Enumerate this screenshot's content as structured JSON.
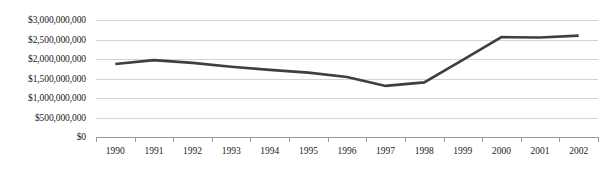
{
  "chart_data": {
    "type": "line",
    "title": "",
    "xlabel": "",
    "ylabel": "",
    "categories": [
      "1990",
      "1991",
      "1992",
      "1993",
      "1994",
      "1995",
      "1996",
      "1997",
      "1998",
      "1999",
      "2000",
      "2001",
      "2002"
    ],
    "values": [
      1870000000,
      1970000000,
      1900000000,
      1800000000,
      1720000000,
      1650000000,
      1540000000,
      1310000000,
      1400000000,
      1980000000,
      2560000000,
      2550000000,
      2600000000
    ],
    "series": [
      {
        "name": "",
        "values": [
          1870000000,
          1970000000,
          1900000000,
          1800000000,
          1720000000,
          1650000000,
          1540000000,
          1310000000,
          1400000000,
          1980000000,
          2560000000,
          2550000000,
          2600000000
        ]
      }
    ],
    "ylim": [
      0,
      3000000000
    ],
    "ytick_values": [
      3000000000,
      2500000000,
      2000000000,
      1500000000,
      1000000000,
      500000000,
      0
    ],
    "ytick_labels": [
      "$3,000,000,000",
      "$2,500,000,000",
      "$2,000,000,000",
      "$1,500,000,000",
      "$1,000,000,000",
      "$500,000,000",
      "$0"
    ],
    "grid": true,
    "legend": "none",
    "line_color": "#3f3f3f",
    "grid_color": "#d4d4d4",
    "axis_color": "#9a9a9a",
    "background_color": "#ffffff"
  }
}
